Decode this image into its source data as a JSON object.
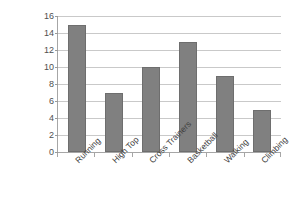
{
  "chart_data": {
    "type": "bar",
    "title": "",
    "xlabel": "",
    "ylabel": "Count",
    "categories": [
      "Running",
      "High Top",
      "Cross Trainers",
      "Basketball",
      "Walking",
      "Climbing"
    ],
    "values": [
      15,
      7,
      10,
      13,
      9,
      5
    ],
    "ylim": [
      0,
      16
    ],
    "ytick_step": 2,
    "yticks": [
      0,
      2,
      4,
      6,
      8,
      10,
      12,
      14,
      16
    ],
    "ytick_labels": [
      "0",
      "2",
      "4",
      "6",
      "8",
      "10",
      "12",
      "14",
      "16"
    ],
    "grid": "horizontal",
    "legend": "none",
    "bar_color": "#808080",
    "bar_border_color": "#6e6e6e",
    "gridline_color": "#c9c9c9",
    "axis_color": "#a6a6a6",
    "background": "#ffffff",
    "xtick_label_rotation": -45
  }
}
